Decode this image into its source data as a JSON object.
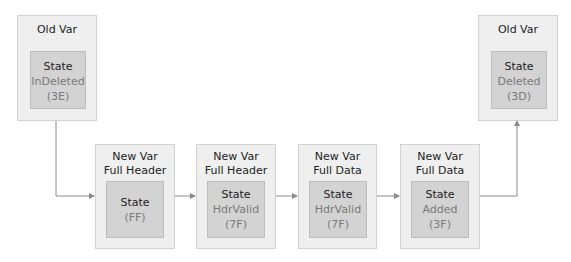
{
  "diagram": {
    "nodes": [
      {
        "id": "old-var-left",
        "title": "Old Var",
        "state_label": "State",
        "state_name": "InDeleted",
        "state_code": "(3E)"
      },
      {
        "id": "new-var-1",
        "title_line1": "New Var",
        "title_line2": "Full Header",
        "state_label": "State",
        "state_name": "",
        "state_code": "(FF)"
      },
      {
        "id": "new-var-2",
        "title_line1": "New Var",
        "title_line2": "Full Header",
        "state_label": "State",
        "state_name": "HdrValid",
        "state_code": "(7F)"
      },
      {
        "id": "new-var-3",
        "title_line1": "New Var",
        "title_line2": "Full Data",
        "state_label": "State",
        "state_name": "HdrValid",
        "state_code": "(7F)"
      },
      {
        "id": "new-var-4",
        "title_line1": "New Var",
        "title_line2": "Full Data",
        "state_label": "State",
        "state_name": "Added",
        "state_code": "(3F)"
      },
      {
        "id": "old-var-right",
        "title": "Old Var",
        "state_label": "State",
        "state_name": "Deleted",
        "state_code": "(3D)"
      }
    ],
    "edges": [
      {
        "from": "old-var-left",
        "to": "new-var-1"
      },
      {
        "from": "new-var-1",
        "to": "new-var-2"
      },
      {
        "from": "new-var-2",
        "to": "new-var-3"
      },
      {
        "from": "new-var-3",
        "to": "new-var-4"
      },
      {
        "from": "new-var-4",
        "to": "old-var-right"
      }
    ],
    "colors": {
      "outer_fill": "#efefef",
      "inner_fill": "#d3d3d3",
      "connector": "#8a8a8a"
    }
  }
}
